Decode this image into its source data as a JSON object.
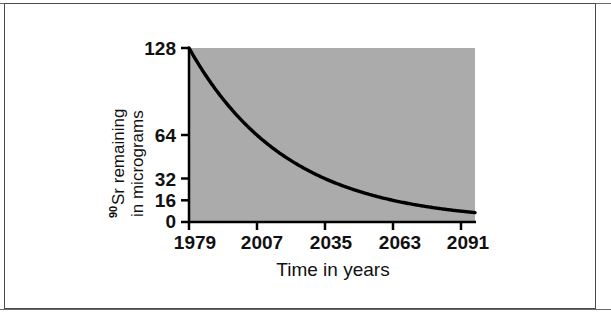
{
  "figure": {
    "background_color": "#ffffff",
    "frame_color": "#4a4a4a",
    "plot_fill_color": "#ababab",
    "curve_color": "#000000",
    "axis_color": "#000000"
  },
  "chart_data": {
    "type": "line",
    "title": "",
    "subtitle": "",
    "xlabel": "Time in years",
    "ylabel_prefix_superscript": "90",
    "ylabel_line1": "Sr remaining",
    "ylabel_line2": "in micrograms",
    "ylabel": "90Sr remaining in micrograms",
    "x_tick_labels": [
      "1979",
      "2007",
      "2035",
      "2063",
      "2091"
    ],
    "x_tick_values": [
      1979,
      2007,
      2035,
      2063,
      2091
    ],
    "y_tick_labels": [
      "128",
      "64",
      "32",
      "16",
      "0"
    ],
    "y_tick_values": [
      128,
      64,
      32,
      16,
      0
    ],
    "xlim": [
      1979,
      2097
    ],
    "ylim": [
      0,
      128
    ],
    "grid": false,
    "legend": false,
    "legend_position": "none",
    "half_life_years": 28,
    "series": [
      {
        "name": "90Sr remaining",
        "x": [
          1979,
          1993,
          2007,
          2021,
          2035,
          2049,
          2063,
          2077,
          2091,
          2097
        ],
        "values": [
          128,
          90.5,
          64,
          45.3,
          32,
          22.6,
          16,
          11.3,
          8,
          6.7
        ]
      }
    ],
    "annotations": []
  }
}
